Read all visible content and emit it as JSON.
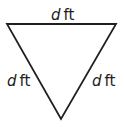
{
  "diagram": {
    "shape": "equilateral triangle (inverted)",
    "stroke_color": "#231f20",
    "labels": {
      "top": {
        "variable": "d",
        "unit": "ft"
      },
      "left": {
        "variable": "d",
        "unit": "ft"
      },
      "right": {
        "variable": "d",
        "unit": "ft"
      }
    }
  }
}
